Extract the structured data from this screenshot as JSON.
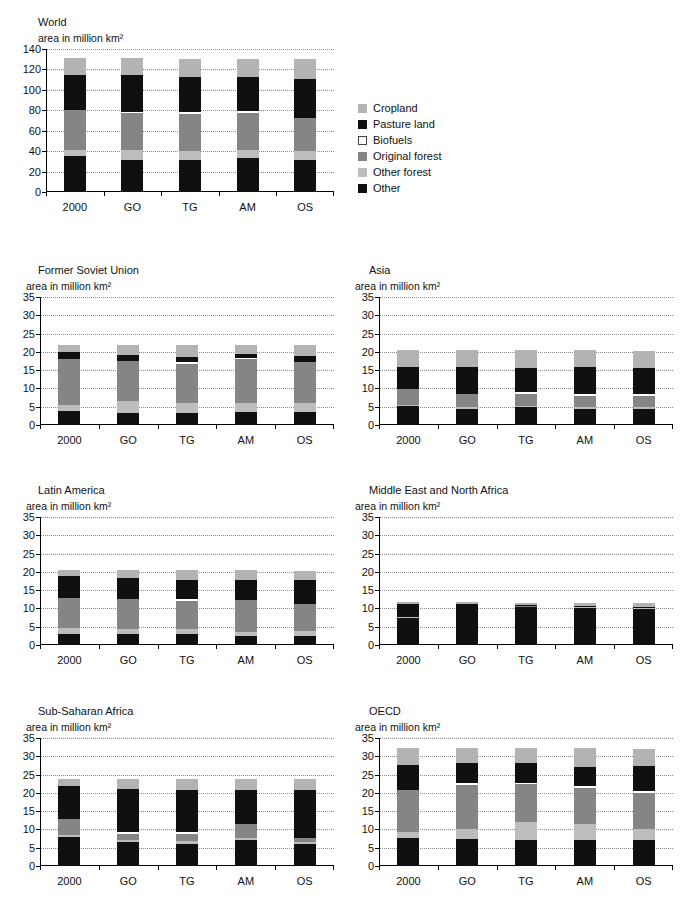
{
  "axis_label": "area in million km²",
  "categories": [
    "2000",
    "GO",
    "TG",
    "AM",
    "OS"
  ],
  "legend": {
    "items": [
      {
        "label": "Cropland",
        "color": "#b3b3b3"
      },
      {
        "label": "Pasture land",
        "color": "#101010"
      },
      {
        "label": "Biofuels",
        "color": "#ffffff"
      },
      {
        "label": "Original forest",
        "color": "#858585"
      },
      {
        "label": "Other forest",
        "color": "#bdbdbd"
      },
      {
        "label": "Other",
        "color": "#101010"
      }
    ]
  },
  "series_order": [
    "Other",
    "Other forest",
    "Original forest",
    "Biofuels",
    "Pasture land",
    "Cropland"
  ],
  "chart_data": [
    {
      "type": "bar",
      "id": "world",
      "title": "World",
      "subtitle": "area in million km²",
      "xlabel": "",
      "ylabel": "area in million km²",
      "ylim": [
        0,
        140
      ],
      "yticks": [
        0,
        20,
        40,
        60,
        80,
        100,
        120,
        140
      ],
      "grid": true,
      "stacked": true,
      "categories": [
        "2000",
        "GO",
        "TG",
        "AM",
        "OS"
      ],
      "series": [
        {
          "name": "Other",
          "color": "#101010",
          "values": [
            35.0,
            31.5,
            31.5,
            33.0,
            31.0
          ]
        },
        {
          "name": "Other forest",
          "color": "#bdbdbd",
          "values": [
            6.0,
            9.5,
            9.0,
            8.0,
            9.0
          ]
        },
        {
          "name": "Original forest",
          "color": "#858585",
          "values": [
            39.0,
            36.0,
            36.0,
            36.0,
            32.0
          ]
        },
        {
          "name": "Biofuels",
          "color": "#ffffff",
          "values": [
            0.0,
            1.5,
            1.5,
            2.5,
            0.0
          ]
        },
        {
          "name": "Pasture land",
          "color": "#101010",
          "values": [
            35.0,
            36.0,
            35.0,
            33.0,
            39.0
          ]
        },
        {
          "name": "Cropland",
          "color": "#b3b3b3",
          "values": [
            16.0,
            16.5,
            17.5,
            18.0,
            19.0
          ]
        }
      ],
      "totals": [
        131.0,
        131.0,
        130.5,
        130.5,
        130.0
      ]
    },
    {
      "type": "bar",
      "id": "former-soviet-union",
      "title": "Former Soviet Union",
      "subtitle": "area in million km²",
      "xlabel": "",
      "ylabel": "area in million km²",
      "ylim": [
        0,
        35
      ],
      "yticks": [
        0,
        5,
        10,
        15,
        20,
        25,
        30,
        35
      ],
      "grid": true,
      "stacked": true,
      "categories": [
        "2000",
        "GO",
        "TG",
        "AM",
        "OS"
      ],
      "series": [
        {
          "name": "Other",
          "color": "#101010",
          "values": [
            3.9,
            3.4,
            3.4,
            3.5,
            3.6
          ]
        },
        {
          "name": "Other forest",
          "color": "#bdbdbd",
          "values": [
            1.5,
            3.1,
            2.6,
            2.5,
            2.3
          ]
        },
        {
          "name": "Original forest",
          "color": "#858585",
          "values": [
            12.6,
            11.1,
            10.6,
            12.0,
            11.2
          ]
        },
        {
          "name": "Biofuels",
          "color": "#ffffff",
          "values": [
            0.0,
            0.0,
            0.6,
            0.3,
            0.0
          ]
        },
        {
          "name": "Pasture land",
          "color": "#101010",
          "values": [
            2.1,
            1.6,
            1.5,
            1.2,
            1.7
          ]
        },
        {
          "name": "Cropland",
          "color": "#b3b3b3",
          "values": [
            1.9,
            2.8,
            3.2,
            2.5,
            3.1
          ]
        }
      ],
      "totals": [
        22.0,
        22.0,
        21.9,
        22.0,
        21.9
      ]
    },
    {
      "type": "bar",
      "id": "asia",
      "title": "Asia",
      "subtitle": "area in million km²",
      "xlabel": "",
      "ylabel": "area in million km²",
      "ylim": [
        0,
        35
      ],
      "yticks": [
        0,
        5,
        10,
        15,
        20,
        25,
        30,
        35
      ],
      "grid": true,
      "stacked": true,
      "categories": [
        "2000",
        "GO",
        "TG",
        "AM",
        "OS"
      ],
      "series": [
        {
          "name": "Other",
          "color": "#101010",
          "values": [
            5.1,
            4.5,
            4.8,
            4.3,
            4.4
          ]
        },
        {
          "name": "Other forest",
          "color": "#bdbdbd",
          "values": [
            0.5,
            0.5,
            0.5,
            0.7,
            0.6
          ]
        },
        {
          "name": "Original forest",
          "color": "#858585",
          "values": [
            4.3,
            3.6,
            3.1,
            2.9,
            3.0
          ]
        },
        {
          "name": "Biofuels",
          "color": "#ffffff",
          "values": [
            0.0,
            0.0,
            0.6,
            0.5,
            0.6
          ]
        },
        {
          "name": "Pasture land",
          "color": "#101010",
          "values": [
            6.1,
            7.2,
            6.6,
            7.6,
            6.9
          ]
        },
        {
          "name": "Cropland",
          "color": "#b3b3b3",
          "values": [
            4.5,
            4.7,
            4.8,
            4.5,
            4.8
          ]
        }
      ],
      "totals": [
        20.5,
        20.5,
        20.4,
        20.5,
        20.3
      ]
    },
    {
      "type": "bar",
      "id": "latin-america",
      "title": "Latin America",
      "subtitle": "area in million km²",
      "xlabel": "",
      "ylabel": "area in million km²",
      "ylim": [
        0,
        35
      ],
      "yticks": [
        0,
        5,
        10,
        15,
        20,
        25,
        30,
        35
      ],
      "grid": true,
      "stacked": true,
      "categories": [
        "2000",
        "GO",
        "TG",
        "AM",
        "OS"
      ],
      "series": [
        {
          "name": "Other",
          "color": "#101010",
          "values": [
            3.1,
            3.0,
            3.0,
            2.5,
            2.5
          ]
        },
        {
          "name": "Other forest",
          "color": "#bdbdbd",
          "values": [
            1.5,
            1.4,
            1.5,
            1.1,
            1.2
          ]
        },
        {
          "name": "Original forest",
          "color": "#858585",
          "values": [
            8.3,
            8.2,
            7.6,
            8.8,
            7.4
          ]
        },
        {
          "name": "Biofuels",
          "color": "#ffffff",
          "values": [
            0.0,
            0.0,
            0.4,
            0.0,
            0.0
          ]
        },
        {
          "name": "Pasture land",
          "color": "#101010",
          "values": [
            6.1,
            5.6,
            5.3,
            5.5,
            6.7
          ]
        },
        {
          "name": "Cropland",
          "color": "#b3b3b3",
          "values": [
            1.4,
            2.2,
            2.6,
            2.5,
            2.4
          ]
        }
      ],
      "totals": [
        20.4,
        20.4,
        20.4,
        20.4,
        20.2
      ]
    },
    {
      "type": "bar",
      "id": "middle-east-north-africa",
      "title": "Middle East and North Africa",
      "subtitle": "area in million km²",
      "xlabel": "",
      "ylabel": "area in million km²",
      "ylim": [
        0,
        35
      ],
      "yticks": [
        0,
        5,
        10,
        15,
        20,
        25,
        30,
        35
      ],
      "grid": true,
      "stacked": true,
      "categories": [
        "2000",
        "GO",
        "TG",
        "AM",
        "OS"
      ],
      "series": [
        {
          "name": "Other",
          "color": "#101010",
          "values": [
            7.5,
            10.6,
            10.4,
            10.2,
            9.9
          ]
        },
        {
          "name": "Other forest",
          "color": "#bdbdbd",
          "values": [
            0.1,
            0.1,
            0.1,
            0.1,
            0.1
          ]
        },
        {
          "name": "Original forest",
          "color": "#858585",
          "values": [
            0.1,
            0.1,
            0.1,
            0.1,
            0.1
          ]
        },
        {
          "name": "Biofuels",
          "color": "#ffffff",
          "values": [
            0.0,
            0.0,
            0.0,
            0.0,
            0.0
          ]
        },
        {
          "name": "Pasture land",
          "color": "#101010",
          "values": [
            3.6,
            0.4,
            0.3,
            0.4,
            0.2
          ]
        },
        {
          "name": "Cropland",
          "color": "#b3b3b3",
          "values": [
            0.5,
            0.5,
            0.6,
            0.7,
            1.1
          ]
        }
      ],
      "totals": [
        11.8,
        11.7,
        11.5,
        11.5,
        11.4
      ]
    },
    {
      "type": "bar",
      "id": "sub-saharan-africa",
      "title": "Sub-Saharan Africa",
      "subtitle": "area in million km²",
      "xlabel": "",
      "ylabel": "area in million km²",
      "ylim": [
        0,
        35
      ],
      "yticks": [
        0,
        5,
        10,
        15,
        20,
        25,
        30,
        35
      ],
      "grid": true,
      "stacked": true,
      "categories": [
        "2000",
        "GO",
        "TG",
        "AM",
        "OS"
      ],
      "series": [
        {
          "name": "Other",
          "color": "#101010",
          "values": [
            8.0,
            6.5,
            6.1,
            7.1,
            6.0
          ]
        },
        {
          "name": "Other forest",
          "color": "#bdbdbd",
          "values": [
            0.6,
            0.6,
            0.7,
            0.6,
            0.6
          ]
        },
        {
          "name": "Original forest",
          "color": "#858585",
          "values": [
            4.2,
            1.7,
            2.0,
            3.9,
            1.0
          ]
        },
        {
          "name": "Biofuels",
          "color": "#ffffff",
          "values": [
            0.0,
            0.5,
            0.5,
            0.0,
            0.0
          ]
        },
        {
          "name": "Pasture land",
          "color": "#101010",
          "values": [
            9.1,
            11.8,
            11.4,
            9.2,
            13.1
          ]
        },
        {
          "name": "Cropland",
          "color": "#b3b3b3",
          "values": [
            2.0,
            2.8,
            3.2,
            2.9,
            3.0
          ]
        }
      ],
      "totals": [
        23.9,
        23.9,
        23.9,
        23.7,
        23.7
      ]
    },
    {
      "type": "bar",
      "id": "oecd",
      "title": "OECD",
      "subtitle": "area in million km²",
      "xlabel": "",
      "ylabel": "area in million km²",
      "ylim": [
        0,
        35
      ],
      "yticks": [
        0,
        5,
        10,
        15,
        20,
        25,
        30,
        35
      ],
      "grid": true,
      "stacked": true,
      "categories": [
        "2000",
        "GO",
        "TG",
        "AM",
        "OS"
      ],
      "series": [
        {
          "name": "Other",
          "color": "#101010",
          "values": [
            7.6,
            7.4,
            7.2,
            7.0,
            7.0
          ]
        },
        {
          "name": "Other forest",
          "color": "#bdbdbd",
          "values": [
            1.8,
            2.8,
            4.9,
            4.5,
            3.1
          ]
        },
        {
          "name": "Original forest",
          "color": "#858585",
          "values": [
            11.5,
            11.9,
            10.2,
            9.8,
            10.0
          ]
        },
        {
          "name": "Biofuels",
          "color": "#ffffff",
          "values": [
            0.0,
            0.5,
            0.5,
            0.6,
            0.5
          ]
        },
        {
          "name": "Pasture land",
          "color": "#101010",
          "values": [
            6.7,
            5.7,
            5.3,
            5.1,
            6.7
          ]
        },
        {
          "name": "Cropland",
          "color": "#b3b3b3",
          "values": [
            4.7,
            4.0,
            4.2,
            5.2,
            4.8
          ]
        }
      ],
      "totals": [
        32.3,
        32.3,
        32.3,
        32.2,
        32.1
      ]
    }
  ]
}
